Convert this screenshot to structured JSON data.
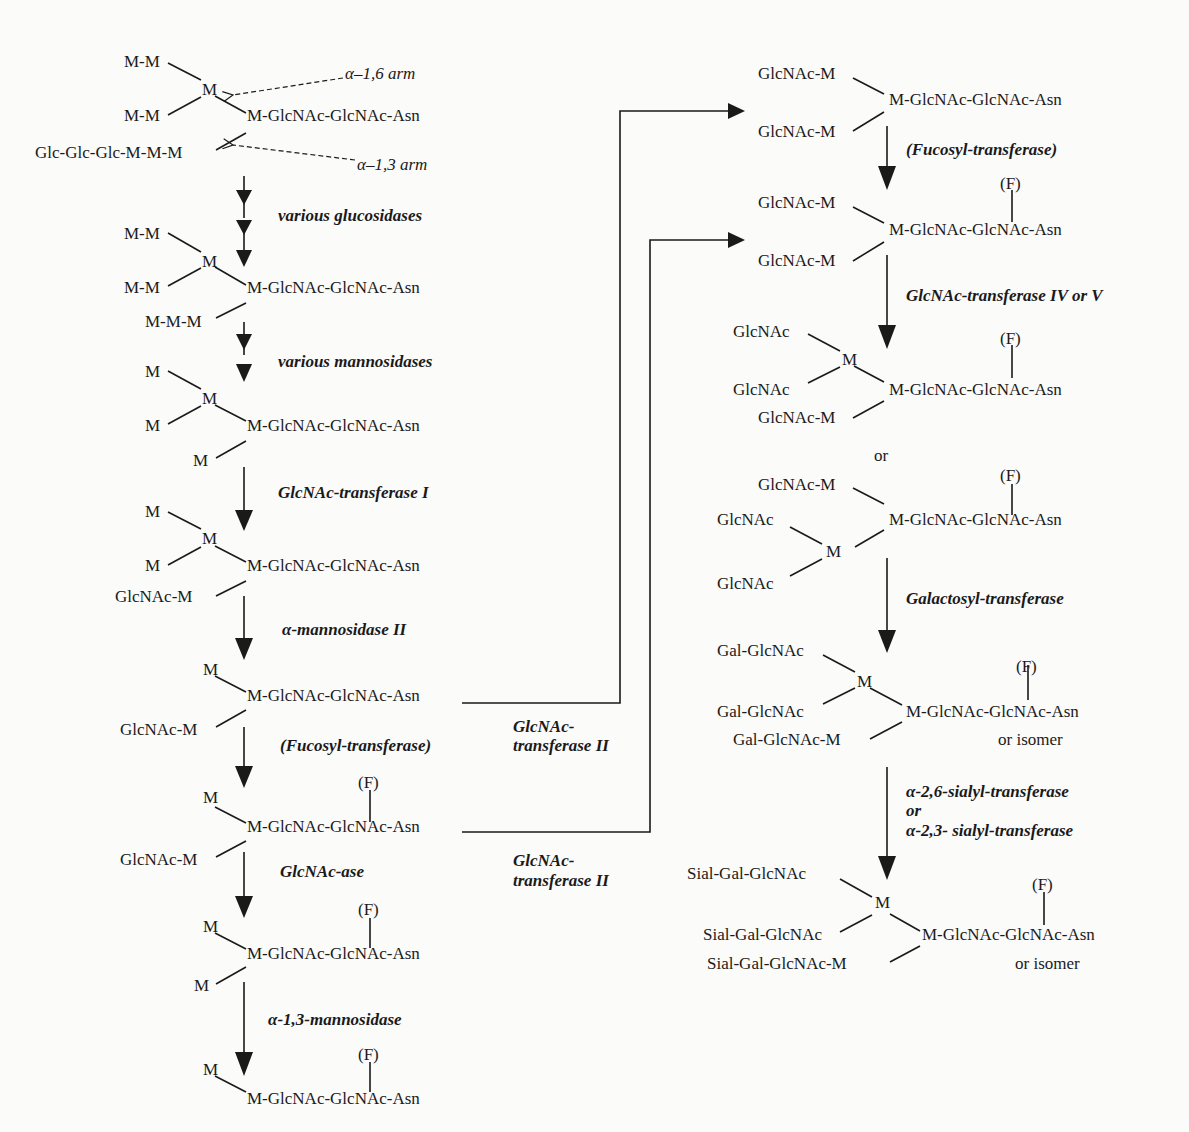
{
  "labels": {
    "alpha16_arm": "α–1,6 arm",
    "alpha13_arm": "α–1,3 arm"
  },
  "left_column": {
    "s1": {
      "upper": "M-M",
      "branch": "M",
      "lower": "M-M",
      "core": "M-GlcNAc-GlcNAc-Asn",
      "alpha13": "Glc-Glc-Glc-M-M-M"
    },
    "e1": "various glucosidases",
    "s2": {
      "upper": "M-M",
      "branch": "M",
      "lower": "M-M",
      "core": "M-GlcNAc-GlcNAc-Asn",
      "alpha13": "M-M-M"
    },
    "e2": "various mannosidases",
    "s3": {
      "upper": "M",
      "branch": "M",
      "lower": "M",
      "core": "M-GlcNAc-GlcNAc-Asn",
      "alpha13": "M"
    },
    "e3": "GlcNAc-transferase I",
    "s4": {
      "upper": "M",
      "branch": "M",
      "lower": "M",
      "core": "M-GlcNAc-GlcNAc-Asn",
      "alpha13": "GlcNAc-M"
    },
    "e4": "α-mannosidase II",
    "s5": {
      "upper": "M",
      "core": "M-GlcNAc-GlcNAc-Asn",
      "alpha13": "GlcNAc-M"
    },
    "e5": "(Fucosyl-transferase)",
    "s6": {
      "fucose": "(F)",
      "upper": "M",
      "core": "M-GlcNAc-GlcNAc-Asn",
      "alpha13": "GlcNAc-M"
    },
    "e6": "GlcNAc-ase",
    "s7": {
      "fucose": "(F)",
      "upper": "M",
      "core": "M-GlcNAc-GlcNAc-Asn",
      "alpha13": "M"
    },
    "e7": "α-1,3-mannosidase",
    "s8": {
      "fucose": "(F)",
      "upper": "M",
      "core": "M-GlcNAc-GlcNAc-Asn"
    }
  },
  "connectors": {
    "gnt2_a_line1": "GlcNAc-",
    "gnt2_a_line2": "transferase II",
    "gnt2_b_line1": "GlcNAc-",
    "gnt2_b_line2": "transferase II"
  },
  "right_column": {
    "r1": {
      "upper": "GlcNAc-M",
      "core": "M-GlcNAc-GlcNAc-Asn",
      "lower": "GlcNAc-M"
    },
    "e1": "(Fucosyl-transferase)",
    "r2": {
      "fucose": "(F)",
      "upper": "GlcNAc-M",
      "core": "M-GlcNAc-GlcNAc-Asn",
      "lower": "GlcNAc-M"
    },
    "e2": "GlcNAc-transferase IV or V",
    "r3": {
      "fucose": "(F)",
      "a": "GlcNAc",
      "branch": "M",
      "b": "GlcNAc",
      "core": "M-GlcNAc-GlcNAc-Asn",
      "lower": "GlcNAc-M"
    },
    "or": "or",
    "r4": {
      "fucose": "(F)",
      "upper": "GlcNAc-M",
      "core": "M-GlcNAc-GlcNAc-Asn",
      "a": "GlcNAc",
      "branch": "M",
      "b": "GlcNAc"
    },
    "e3": "Galactosyl-transferase",
    "r5": {
      "fucose": "(F)",
      "a": "Gal-GlcNAc",
      "branch": "M",
      "b": "Gal-GlcNAc",
      "core": "M-GlcNAc-GlcNAc-Asn",
      "lower": "Gal-GlcNAc-M",
      "isomer": "or isomer"
    },
    "e4_line1": "α-2,6-sialyl-transferase",
    "e4_line2": "or",
    "e4_line3": "α-2,3- sialyl-transferase",
    "r6": {
      "fucose": "(F)",
      "a": "Sial-Gal-GlcNAc",
      "branch": "M",
      "b": "Sial-Gal-GlcNAc",
      "core": "M-GlcNAc-GlcNAc-Asn",
      "lower": "Sial-Gal-GlcNAc-M",
      "isomer": "or isomer"
    }
  },
  "colors": {
    "ink": "#1a1a1a",
    "paper": "#fbfbfa"
  }
}
